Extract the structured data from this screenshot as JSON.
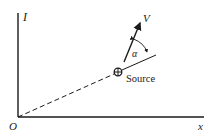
{
  "diagram": {
    "axes": {
      "vertical_label": "I",
      "horizontal_label": "x",
      "origin_label": "O"
    },
    "source": {
      "label": "Source",
      "symbol": "circled-plus"
    },
    "velocity": {
      "label": "V"
    },
    "angle": {
      "label": "α"
    },
    "colors": {
      "ink": "#1a1a1a",
      "background": "#ffffff"
    }
  }
}
